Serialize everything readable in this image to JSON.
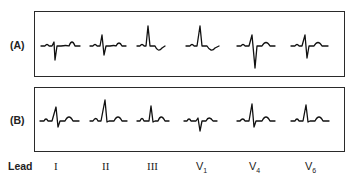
{
  "rows": [
    {
      "label": "(A)"
    },
    {
      "label": "(B)"
    }
  ],
  "lead_axis": {
    "title": "Lead",
    "leads": [
      {
        "name": "I"
      },
      {
        "name": "II"
      },
      {
        "name": "III"
      },
      {
        "main": "V",
        "sub": "1"
      },
      {
        "main": "V",
        "sub": "4"
      },
      {
        "main": "V",
        "sub": "6"
      }
    ]
  },
  "colors": {
    "trace": "#111111",
    "border": "#2a2a2a",
    "background": "#ffffff"
  }
}
